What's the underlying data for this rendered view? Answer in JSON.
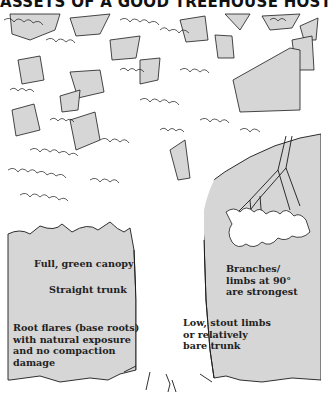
{
  "title": "ASSETS OF A GOOD TREEHOUSE HOST",
  "colors": {
    "background": "#ffffff",
    "panel_fill": "#d6d6d6",
    "outline": "#1a1a1a",
    "text": "#222222"
  },
  "labels": {
    "canopy": "Full, green canopy",
    "trunk": "Straight trunk",
    "root_flares": "Root flares (base roots)\nwith natural exposure\nand no compaction\ndamage",
    "branches": "Branches/\nlimbs at 90°\nare strongest",
    "low_limbs": "Low, stout limbs\nor relatively\nbare trunk"
  },
  "illustration": {
    "subject": "tree-with-canopy-trunk-and-roots",
    "icon": "tree-icon"
  }
}
